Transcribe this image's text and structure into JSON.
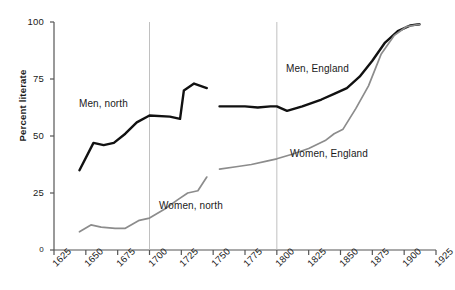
{
  "chart_data": {
    "type": "line",
    "title": "",
    "xlabel": "",
    "ylabel": "Percent literate",
    "xlim": [
      1625,
      1925
    ],
    "ylim": [
      0,
      100
    ],
    "grid": "two vertical reference lines at 1700 and 1800",
    "legend_position": "inline annotations next to each series",
    "xticks": [
      "1625",
      "1650",
      "1675",
      "1700",
      "1725",
      "1750",
      "1775",
      "1800",
      "1825",
      "1850",
      "1875",
      "1900",
      "1925"
    ],
    "yticks": [
      "0",
      "25",
      "50",
      "75",
      "100"
    ],
    "gridlines_x": [
      1700,
      1800
    ],
    "series": [
      {
        "name": "Men, north",
        "color": "#111111",
        "label": "Men, north",
        "x": [
          1645,
          1656,
          1664,
          1672,
          1681,
          1690,
          1700,
          1716,
          1724,
          1727,
          1735,
          1745
        ],
        "values": [
          35,
          47,
          46,
          47,
          51,
          56,
          59,
          58.5,
          57.5,
          70,
          73,
          71
        ]
      },
      {
        "name": "Women, north",
        "color": "#8c8c8c",
        "label": "Women, north",
        "x": [
          1645,
          1654,
          1662,
          1673,
          1681,
          1692,
          1700,
          1712,
          1722,
          1730,
          1738,
          1745
        ],
        "values": [
          8,
          11,
          10,
          9.5,
          9.5,
          13,
          14,
          18,
          22,
          25,
          26,
          32
        ]
      },
      {
        "name": "Men, England",
        "color": "#111111",
        "label": "Men, England",
        "x": [
          1755,
          1765,
          1775,
          1785,
          1795,
          1800,
          1808,
          1820,
          1835,
          1845,
          1855,
          1865,
          1875,
          1885,
          1895,
          1905,
          1912
        ],
        "values": [
          63,
          63,
          63,
          62.5,
          63,
          63,
          61,
          63,
          66,
          68.5,
          71,
          76,
          83,
          91,
          96,
          98.5,
          99
        ]
      },
      {
        "name": "Women, England",
        "color": "#8c8c8c",
        "label": "Women, England",
        "x": [
          1755,
          1768,
          1780,
          1792,
          1800,
          1812,
          1825,
          1838,
          1845,
          1852,
          1862,
          1872,
          1882,
          1892,
          1902,
          1912
        ],
        "values": [
          35.5,
          36.5,
          37.5,
          39,
          40,
          42,
          44.5,
          48,
          51,
          53,
          62,
          72,
          86,
          94,
          98,
          99
        ]
      }
    ],
    "annotations": [
      {
        "text": "Men, north",
        "x_px": 79,
        "y_px": 98
      },
      {
        "text": "Women, north",
        "x_px": 159,
        "y_px": 200
      },
      {
        "text": "Men, England",
        "x_px": 286,
        "y_px": 63
      },
      {
        "text": "Women, England",
        "x_px": 290,
        "y_px": 148
      }
    ]
  },
  "axis": {
    "y_title": "Percent literate"
  }
}
